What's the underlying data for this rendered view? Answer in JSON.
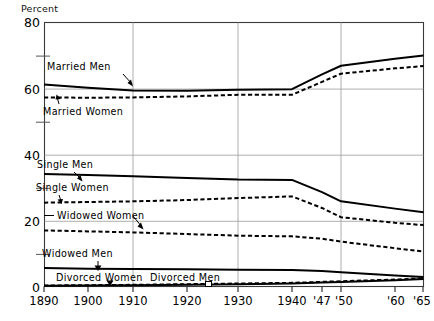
{
  "chart_data": {
    "type": "line",
    "title": "",
    "xlabel": "",
    "ylabel": "Percent",
    "ylim": [
      0,
      80
    ],
    "ytick_values": [
      0,
      20,
      40,
      60,
      80
    ],
    "yminor_values": [
      10,
      30,
      50,
      70
    ],
    "grid": true,
    "gridlines_x": [
      1910,
      1930,
      1950
    ],
    "legend_position": "inline-annotations",
    "x": [
      1890,
      1900,
      1910,
      1920,
      1930,
      1940,
      1947,
      1950,
      1960,
      1965
    ],
    "xtick_labels": [
      "1890",
      "1900",
      "1910",
      "1920",
      "1930",
      "1940",
      "'47",
      "'50",
      "'60",
      "'65"
    ],
    "series": [
      {
        "name": "Married Men",
        "style": "solid",
        "values": [
          61.2,
          60.2,
          59.4,
          59.3,
          59.6,
          59.8,
          64.3,
          66.9,
          69.0,
          70.0
        ]
      },
      {
        "name": "Married Women",
        "style": "dashed",
        "values": [
          57.3,
          57.2,
          57.3,
          57.6,
          58.1,
          58.1,
          62.0,
          64.5,
          66.1,
          66.8
        ]
      },
      {
        "name": "Single Men",
        "style": "solid",
        "values": [
          34.1,
          33.8,
          33.4,
          32.9,
          32.4,
          32.3,
          28.6,
          25.8,
          23.6,
          22.5
        ]
      },
      {
        "name": "Single Women",
        "style": "dashed",
        "values": [
          25.4,
          25.6,
          25.8,
          26.2,
          26.8,
          27.3,
          23.8,
          21.0,
          19.3,
          18.6
        ]
      },
      {
        "name": "Widowed Women",
        "style": "dashed",
        "values": [
          17.0,
          16.7,
          16.4,
          15.9,
          15.4,
          15.2,
          14.5,
          13.6,
          11.6,
          10.6
        ]
      },
      {
        "name": "Widowed Men",
        "style": "solid",
        "values": [
          5.6,
          5.4,
          5.3,
          5.2,
          5.1,
          5.0,
          4.7,
          4.3,
          3.3,
          2.9
        ]
      },
      {
        "name": "Divorced Men",
        "style": "solid",
        "values": [
          0.2,
          0.3,
          0.4,
          0.5,
          0.7,
          0.9,
          1.2,
          1.4,
          1.9,
          2.3
        ]
      },
      {
        "name": "Divorced Women",
        "style": "dashed",
        "values": [
          0.3,
          0.4,
          0.5,
          0.7,
          0.9,
          1.1,
          1.4,
          1.6,
          2.1,
          2.5
        ]
      }
    ],
    "annotations": [
      {
        "text": "Married Men",
        "x_px": 47,
        "y_px": 70
      },
      {
        "text": "Married Women",
        "x_px": 43,
        "y_px": 112
      },
      {
        "text": "Single Men",
        "x_px": 37,
        "y_px": 167
      },
      {
        "text": "Single Women",
        "x_px": 36,
        "y_px": 190
      },
      {
        "text": "Widowed Women",
        "x_px": 50,
        "y_px": 218
      },
      {
        "text": "Widowed Men",
        "x_px": 42,
        "y_px": 255
      },
      {
        "text": "Divorced Women",
        "x_px": 56,
        "y_px": 279
      },
      {
        "text": "Divorced Men",
        "x_px": 150,
        "y_px": 279
      }
    ]
  }
}
